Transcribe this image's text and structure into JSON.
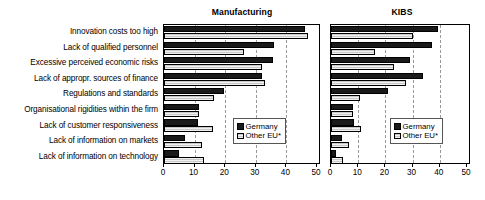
{
  "chart_data": [
    {
      "type": "bar",
      "title": "Manufacturing",
      "orientation": "horizontal",
      "xlabel": "",
      "ylabel": "",
      "xlim": [
        0,
        50
      ],
      "xticks": [
        0,
        10,
        20,
        30,
        40,
        50
      ],
      "grid": "vertical-dashed",
      "legend_position": "lower-right",
      "categories": [
        "Innovation costs too high",
        "Lack of qualified personnel",
        "Excessive perceived economic risks",
        "Lack of appropr. sources of finance",
        "Regulations and standards",
        "Organisational rigidities within the firm",
        "Lack of customer responsiveness",
        "Lack of information on markets",
        "Lack of information on technology"
      ],
      "series": [
        {
          "name": "Germany",
          "color": "#1a1a1a",
          "values": [
            46,
            36,
            35.5,
            32,
            19.5,
            11.5,
            11,
            7,
            5
          ]
        },
        {
          "name": "Other EU*",
          "color": "#c9c9c9",
          "values": [
            47,
            26,
            32,
            33,
            16.5,
            11.5,
            16,
            12.5,
            13
          ]
        }
      ]
    },
    {
      "type": "bar",
      "title": "KIBS",
      "orientation": "horizontal",
      "xlabel": "",
      "ylabel": "",
      "xlim": [
        0,
        50
      ],
      "xticks": [
        0,
        10,
        20,
        30,
        40,
        50
      ],
      "grid": "vertical-dashed",
      "legend_position": "lower-right",
      "categories": [
        "Innovation costs too high",
        "Lack of qualified personnel",
        "Excessive perceived economic risks",
        "Lack of appropr. sources of finance",
        "Regulations and standards",
        "Organisational rigidities within the firm",
        "Lack of customer responsiveness",
        "Lack of information on markets",
        "Lack of information on technology"
      ],
      "series": [
        {
          "name": "Germany",
          "color": "#1a1a1a",
          "values": [
            39.5,
            37,
            29,
            34,
            21,
            8,
            8.5,
            4,
            2
          ]
        },
        {
          "name": "Other EU*",
          "color": "#c9c9c9",
          "values": [
            30,
            16,
            23,
            27.5,
            10.5,
            8,
            11,
            6.5,
            4.5
          ]
        }
      ]
    }
  ],
  "row_labels": [
    "Innovation costs too high",
    "Lack of qualified personnel",
    "Excessive perceived economic risks",
    "Lack of appropr. sources of finance",
    "Regulations and standards",
    "Organisational rigidities within the firm",
    "Lack of customer responsiveness",
    "Lack of information on markets",
    "Lack of information on technology"
  ],
  "panels": [
    {
      "title": "Manufacturing"
    },
    {
      "title": "KIBS"
    }
  ],
  "legend": {
    "germany": "Germany",
    "other_eu": "Other EU*"
  }
}
